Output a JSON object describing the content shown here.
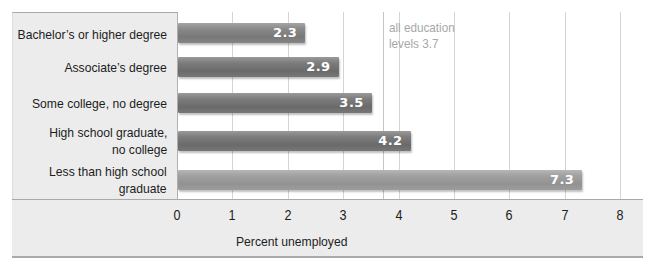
{
  "chart_data": {
    "type": "bar",
    "orientation": "horizontal",
    "title": "",
    "categories": [
      "Bachelor's or higher degree",
      "Associate's degree",
      "Some college, no degree",
      "High school graduate, no college",
      "Less than high school graduate"
    ],
    "values": [
      2.3,
      2.9,
      3.5,
      4.2,
      7.3
    ],
    "value_labels": [
      "2.3",
      "2.9",
      "3.5",
      "4.2",
      "7.3"
    ],
    "xlabel": "Percent unemployed",
    "ylabel": "",
    "xlim": [
      0,
      8
    ],
    "xticks": [
      "0",
      "1",
      "2",
      "3",
      "4",
      "5",
      "6",
      "7",
      "8"
    ],
    "grid": true,
    "reference_line": {
      "value": 3.7,
      "label": "all education\nlevels 3.7"
    },
    "legend": null
  },
  "labels": {
    "cat0": "Bachelor’s or higher degree",
    "cat1": "Associate’s degree",
    "cat2": "Some college, no degree",
    "cat3": "High school graduate,\nno college",
    "cat4": "Less than high school\ngraduate",
    "ref": "all education\nlevels 3.7"
  },
  "colors": {
    "bar_dark": "#6f6f6f",
    "bar_light": "#9a9a9a",
    "panel_bg": "#ececec",
    "bar_value_text": "#ffffff",
    "ref_label_text": "#a8a8a8"
  }
}
